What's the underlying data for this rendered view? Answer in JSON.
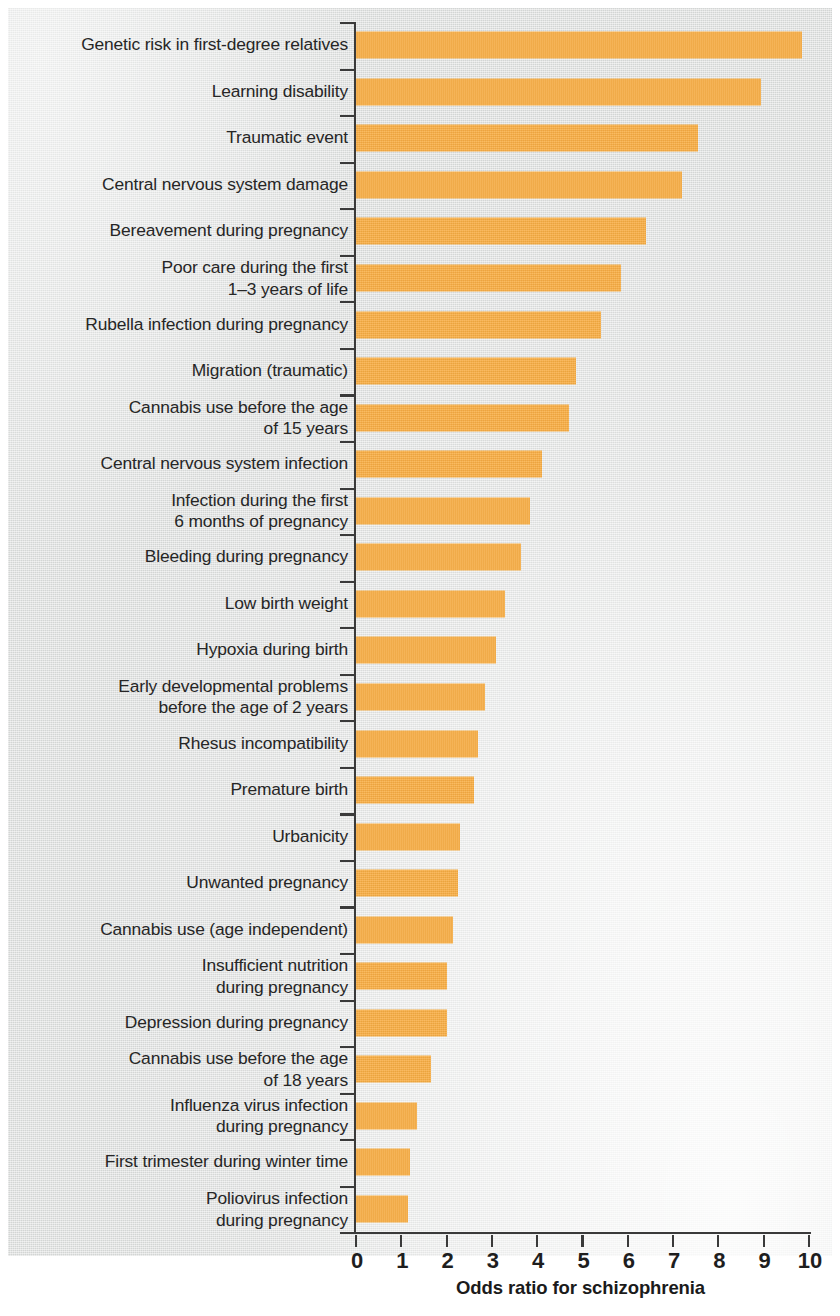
{
  "chart_data": {
    "type": "bar",
    "orientation": "horizontal",
    "title": "",
    "xlabel": "Odds ratio for schizophrenia",
    "ylabel": "",
    "xlim": [
      0,
      10
    ],
    "ylim": null,
    "grid": false,
    "legend": null,
    "xticks": [
      "0",
      "1",
      "2",
      "3",
      "4",
      "5",
      "6",
      "7",
      "8",
      "9",
      "10"
    ],
    "bar_color": "#f9ad42",
    "background_color": "#dcdedd",
    "axis_color": "#3a3a3a",
    "categories": [
      "Genetic risk in first-degree relatives",
      "Learning disability",
      "Traumatic event",
      "Central nervous system damage",
      "Bereavement during pregnancy",
      "Poor care during the first\n1–3 years of life",
      "Rubella infection during pregnancy",
      "Migration (traumatic)",
      "Cannabis use before the age\nof 15 years",
      "Central nervous system infection",
      "Infection during the first\n6 months of pregnancy",
      "Bleeding during pregnancy",
      "Low birth weight",
      "Hypoxia during birth",
      "Early developmental problems\nbefore the age of 2 years",
      "Rhesus incompatibility",
      "Premature birth",
      "Urbanicity",
      "Unwanted pregnancy",
      "Cannabis use (age independent)",
      "Insufficient nutrition\nduring pregnancy",
      "Depression during pregnancy",
      "Cannabis use before the age\nof 18 years",
      "Influenza virus infection\nduring pregnancy",
      "First trimester during winter time",
      "Poliovirus infection\nduring pregnancy"
    ],
    "values": [
      9.85,
      8.95,
      7.55,
      7.2,
      6.4,
      5.85,
      5.4,
      4.85,
      4.7,
      4.1,
      3.85,
      3.65,
      3.3,
      3.1,
      2.85,
      2.7,
      2.6,
      2.3,
      2.25,
      2.15,
      2.0,
      2.0,
      1.65,
      1.35,
      1.2,
      1.15
    ]
  }
}
